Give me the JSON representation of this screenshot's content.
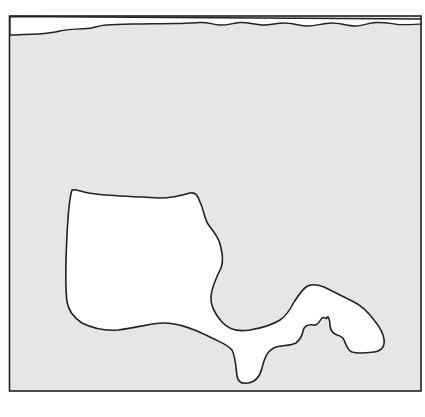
{
  "figure": {
    "colors": {
      "background": "#ffffff",
      "fill_region": "#e6e6e6",
      "outline": "#222222",
      "shape_fill": "#ffffff"
    },
    "elements": [
      {
        "name": "outer-frame",
        "type": "rectangle"
      },
      {
        "name": "top-strip",
        "type": "wavy-band"
      },
      {
        "name": "left-lobe",
        "type": "irregular-shape"
      },
      {
        "name": "right-lobe",
        "type": "irregular-shape"
      }
    ]
  }
}
